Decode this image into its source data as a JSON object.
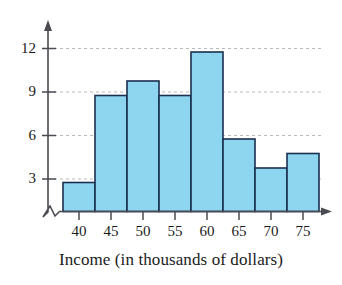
{
  "chart_data": {
    "type": "bar",
    "title": "",
    "subtitle": "",
    "xlabel": "Income (in thousands of dollars)",
    "ylabel": "",
    "categories": [
      "40",
      "45",
      "50",
      "55",
      "60",
      "65",
      "70",
      "75"
    ],
    "values": [
      2,
      8,
      9,
      8,
      11,
      5,
      3,
      4
    ],
    "x_tick_labels": [
      "40",
      "45",
      "50",
      "55",
      "60",
      "65",
      "70",
      "75"
    ],
    "y_tick_labels": [
      "3",
      "6",
      "9",
      "12"
    ],
    "y_tick_values": [
      3,
      6,
      9,
      12
    ],
    "ylim": [
      0,
      13
    ],
    "xlim_note": "bins of width 5 centered on tick labels",
    "grid": "horizontal dashed gridlines at 3, 6, 9, 12",
    "axis_break": "zigzag break on vertical axis near origin",
    "legend": "none",
    "bar_fill_color": "#8ed6ef",
    "bar_border_color": "#1b2f4e",
    "gridline_color": "#b8b8b8",
    "axis_color": "#4a4a52"
  },
  "figure": {
    "x_axis_title": "Income (in thousands of dollars)"
  }
}
